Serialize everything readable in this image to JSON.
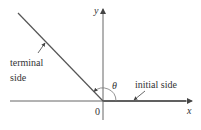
{
  "diagram": {
    "labels": {
      "y_axis": "y",
      "x_axis": "x",
      "origin": "0",
      "angle": "θ",
      "terminal_line1": "terminal",
      "terminal_line2": "side",
      "initial": "initial side"
    },
    "colors": {
      "line": "#555555",
      "text": "#333333",
      "background": "#ffffff"
    }
  }
}
